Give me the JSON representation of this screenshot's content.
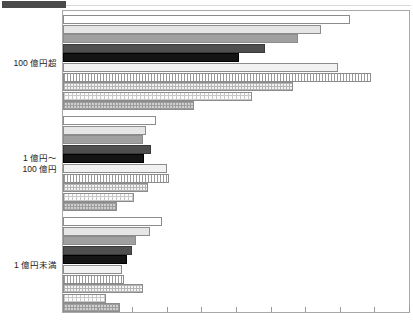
{
  "header": {
    "tab_label": ""
  },
  "chart_data": {
    "type": "bar",
    "orientation": "horizontal",
    "title": "",
    "subtitle": "",
    "xlabel": "",
    "ylabel": "",
    "grid": false,
    "legend_position": "none",
    "xlim": [
      0,
      100
    ],
    "xticks": [
      0,
      10,
      20,
      30,
      40,
      50,
      60,
      70,
      80,
      90,
      100
    ],
    "xtick_labels": [
      "",
      "",
      "",
      "",
      "",
      "",
      "",
      "",
      "",
      "",
      ""
    ],
    "categories": [
      "100 億円超",
      "1 億円～\n100 億円",
      "1 億円未満"
    ],
    "category_labels": [
      {
        "line1": "100 億円超",
        "line2": ""
      },
      {
        "line1": "1 億円～",
        "line2": "100 億円"
      },
      {
        "line1": "1 億円未満",
        "line2": ""
      }
    ],
    "series": [
      {
        "name": "series-1",
        "pattern": "white",
        "values": [
          83.0,
          27.0,
          28.5
        ]
      },
      {
        "name": "series-2",
        "pattern": "lightgray",
        "values": [
          74.5,
          24.0,
          25.0
        ]
      },
      {
        "name": "series-3",
        "pattern": "gray",
        "values": [
          68.0,
          23.0,
          21.0
        ]
      },
      {
        "name": "series-4",
        "pattern": "darkgray",
        "values": [
          58.5,
          25.5,
          20.0
        ]
      },
      {
        "name": "series-5",
        "pattern": "black",
        "values": [
          51.0,
          23.5,
          18.5
        ]
      },
      {
        "name": "series-6",
        "pattern": "palehatch",
        "values": [
          79.5,
          30.0,
          17.0
        ]
      },
      {
        "name": "series-7",
        "pattern": "vstripe",
        "values": [
          89.0,
          30.5,
          17.5
        ]
      },
      {
        "name": "series-8",
        "pattern": "checker",
        "values": [
          66.5,
          24.5,
          23.0
        ]
      },
      {
        "name": "series-9",
        "pattern": "finedot",
        "values": [
          54.5,
          20.5,
          12.5
        ]
      },
      {
        "name": "series-10",
        "pattern": "meddot",
        "values": [
          38.0,
          15.5,
          16.5
        ]
      }
    ],
    "bars_per_group": 10,
    "group_count": 3
  }
}
